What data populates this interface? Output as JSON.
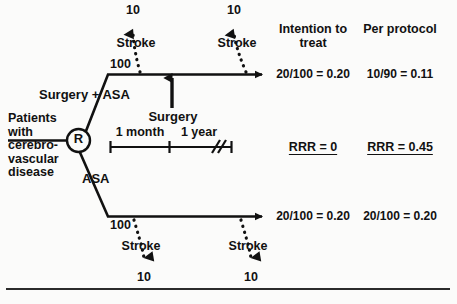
{
  "diagram": {
    "type": "randomized-controlled-trial-flow",
    "population_label": "Patients\nwith\ncerebro-\nvascular\ndisease",
    "randomization_node": "R",
    "timeline": {
      "segment_1": "1 month",
      "segment_2": "1 year",
      "break_mark": "//"
    },
    "intervention_arrow_label": "Surgery",
    "arms": [
      {
        "id": "surgery-asa",
        "label": "Surgery + ASA",
        "n_randomized": "100",
        "events": [
          {
            "label": "Stroke",
            "count": "10",
            "timing": "early"
          },
          {
            "label": "Stroke",
            "count": "10",
            "timing": "late"
          }
        ],
        "intention_to_treat": "20/100 = 0.20",
        "per_protocol": "10/90 = 0.11"
      },
      {
        "id": "asa",
        "label": "ASA",
        "n_randomized": "100",
        "events": [
          {
            "label": "Stroke",
            "count": "10",
            "timing": "early"
          },
          {
            "label": "Stroke",
            "count": "10",
            "timing": "late"
          }
        ],
        "intention_to_treat": "20/100 = 0.20",
        "per_protocol": "20/100 = 0.20"
      }
    ],
    "columns": [
      {
        "id": "itt",
        "header_line1": "Intention to",
        "header_line2": "treat",
        "summary": "RRR = 0"
      },
      {
        "id": "pp",
        "header_line1": "Per protocol",
        "header_line2": "",
        "summary": "RRR = 0.45"
      }
    ],
    "colors": {
      "ink": "#111111",
      "rule": "#2b2b2b",
      "background": "#fbfbfa"
    }
  }
}
